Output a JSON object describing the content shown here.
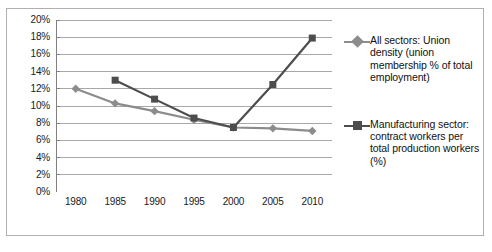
{
  "chart_data": {
    "type": "line",
    "title": "",
    "subtitle": "",
    "xlabel": "",
    "ylabel": "",
    "x": [
      1980,
      1985,
      1990,
      1995,
      2000,
      2005,
      2010
    ],
    "categories": [
      "1980",
      "1985",
      "1990",
      "1995",
      "2000",
      "2005",
      "2010"
    ],
    "ylim": [
      0,
      20
    ],
    "ytick_step": 2,
    "ytick_labels": [
      "0%",
      "2%",
      "4%",
      "6%",
      "8%",
      "10%",
      "12%",
      "14%",
      "16%",
      "18%",
      "20%"
    ],
    "ytick_values": [
      0,
      2,
      4,
      6,
      8,
      10,
      12,
      14,
      16,
      18,
      20
    ],
    "grid": "horizontal",
    "legend_position": "right",
    "series": [
      {
        "name": "All sectors: Union density (union membership % of total employment)",
        "color": "#8c8c8c",
        "marker": "diamond",
        "x": [
          1980,
          1985,
          1990,
          1995,
          2000,
          2005,
          2010
        ],
        "values": [
          12.0,
          10.3,
          9.4,
          8.4,
          7.5,
          7.4,
          7.1
        ]
      },
      {
        "name": "Manufacturing sector: contract workers per total production workers (%)",
        "color": "#4d4d4d",
        "marker": "square",
        "x": [
          1985,
          1990,
          1995,
          2000,
          2005,
          2010
        ],
        "values": [
          13.0,
          10.8,
          8.6,
          7.5,
          12.5,
          17.9
        ]
      }
    ]
  },
  "legend": {
    "entries": [
      {
        "label": "All sectors: Union density (union membership % of total employment)",
        "marker": "diamond-marker",
        "color": "#8c8c8c"
      },
      {
        "label": "Manufacturing sector: contract workers per total production workers (%)",
        "marker": "square-marker",
        "color": "#4d4d4d"
      }
    ]
  },
  "colors": {
    "series_light": "#8c8c8c",
    "series_dark": "#4d4d4d",
    "gridline": "#a8a8a8",
    "axis": "#808080",
    "border": "#b0b0b0",
    "text": "#1a1a1a",
    "background": "#ffffff"
  }
}
